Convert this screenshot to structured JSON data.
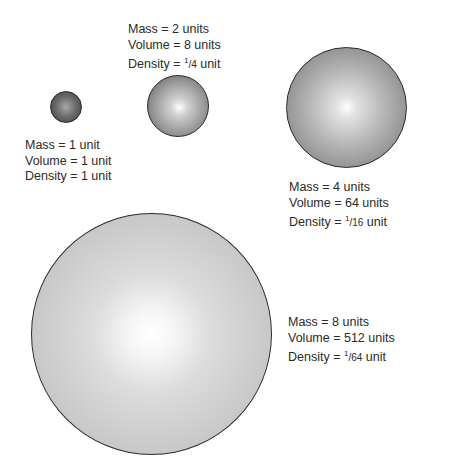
{
  "spheres": [
    {
      "mass": "Mass = 1 unit",
      "volume": "Volume = 1 unit",
      "density": "Density = 1 unit"
    },
    {
      "mass": "Mass = 2 units",
      "volume": "Volume = 8 units",
      "density_prefix": "Density = ",
      "density_num": "1",
      "density_den": "/4",
      "density_suffix": " unit"
    },
    {
      "mass": "Mass = 4 units",
      "volume": "Volume = 64 units",
      "density_prefix": "Density = ",
      "density_num": "1",
      "density_den": "/16",
      "density_suffix": " unit"
    },
    {
      "mass": "Mass = 8 units",
      "volume": "Volume = 512 units",
      "density_prefix": "Density = ",
      "density_num": "1",
      "density_den": "/64",
      "density_suffix": " unit"
    }
  ]
}
